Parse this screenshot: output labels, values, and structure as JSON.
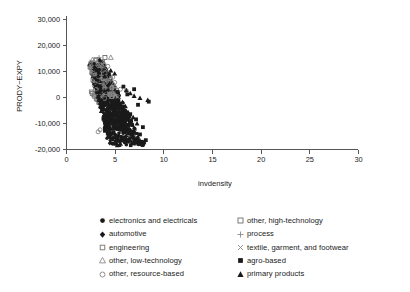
{
  "chart_data": {
    "type": "scatter",
    "title": "",
    "xlabel": "invdensity",
    "ylabel": "PRODY−EXPY",
    "xlim": [
      0,
      30
    ],
    "ylim": [
      -20000,
      30000
    ],
    "xticks": [
      0,
      5,
      10,
      15,
      20,
      25,
      30
    ],
    "xticklabels": [
      "0",
      "5",
      "10",
      "15",
      "20",
      "25",
      "30"
    ],
    "yticks": [
      30000,
      20000,
      10000,
      0,
      -10000,
      -20000
    ],
    "yticklabels": [
      "30,000",
      "20,000",
      "10,000",
      "0",
      "-10,000",
      "-20,000"
    ],
    "grid": false,
    "legend_position": "below-plot",
    "marker_color": "#1a1a1a",
    "axis_color": "#555555",
    "series": [
      {
        "name": "electronics and electricals",
        "marker": "filled-circle",
        "points": [
          [
            3.0,
            9800
          ],
          [
            3.2,
            8200
          ],
          [
            3.4,
            6400
          ],
          [
            3.6,
            5100
          ],
          [
            3.8,
            3900
          ],
          [
            3.1,
            7400
          ],
          [
            3.3,
            5600
          ],
          [
            3.5,
            4300
          ],
          [
            3.7,
            2800
          ],
          [
            3.9,
            1500
          ],
          [
            4.0,
            600
          ],
          [
            4.2,
            -900
          ],
          [
            4.4,
            -2400
          ],
          [
            4.6,
            -3800
          ],
          [
            4.8,
            -5200
          ],
          [
            4.1,
            -200
          ],
          [
            4.3,
            -1700
          ],
          [
            4.5,
            -3100
          ],
          [
            4.7,
            -4500
          ],
          [
            4.9,
            -6000
          ],
          [
            5.0,
            -6800
          ],
          [
            5.2,
            -8100
          ],
          [
            5.4,
            -9400
          ],
          [
            5.6,
            -10600
          ],
          [
            5.8,
            -11800
          ],
          [
            5.1,
            -7400
          ],
          [
            5.3,
            -8800
          ],
          [
            5.5,
            -10000
          ],
          [
            5.7,
            -11200
          ],
          [
            5.9,
            -12400
          ],
          [
            6.0,
            -13000
          ],
          [
            6.2,
            -13900
          ],
          [
            6.4,
            -14700
          ],
          [
            6.6,
            -15400
          ],
          [
            6.8,
            -16000
          ],
          [
            6.1,
            -13400
          ],
          [
            6.3,
            -14300
          ],
          [
            6.5,
            -15100
          ],
          [
            6.7,
            -15800
          ],
          [
            6.9,
            -16400
          ],
          [
            7.0,
            -16800
          ],
          [
            7.2,
            -17200
          ],
          [
            7.4,
            -17500
          ],
          [
            7.6,
            -17800
          ],
          [
            7.8,
            -18000
          ],
          [
            3.45,
            2200
          ],
          [
            3.85,
            700
          ],
          [
            4.25,
            -1200
          ],
          [
            4.65,
            -3400
          ],
          [
            5.05,
            -5900
          ],
          [
            2.9,
            6100
          ],
          [
            3.05,
            4700
          ],
          [
            3.15,
            3300
          ],
          [
            3.25,
            2000
          ],
          [
            3.55,
            900
          ],
          [
            4.15,
            -2600
          ],
          [
            4.55,
            -4800
          ],
          [
            4.95,
            -7000
          ],
          [
            5.35,
            -9200
          ],
          [
            5.75,
            -11500
          ],
          [
            6.15,
            -12900
          ],
          [
            6.55,
            -14900
          ],
          [
            6.95,
            -16600
          ],
          [
            7.35,
            -17600
          ],
          [
            7.75,
            -18200
          ]
        ]
      },
      {
        "name": "automotive",
        "marker": "filled-diamond",
        "points": [
          [
            3.3,
            7200
          ],
          [
            3.6,
            5400
          ],
          [
            3.9,
            3600
          ],
          [
            4.2,
            1800
          ],
          [
            4.5,
            -300
          ],
          [
            4.8,
            -2500
          ],
          [
            5.1,
            -4800
          ],
          [
            5.4,
            -7000
          ],
          [
            5.7,
            -9200
          ],
          [
            6.0,
            -11000
          ],
          [
            6.3,
            -12600
          ],
          [
            6.6,
            -14000
          ],
          [
            6.9,
            -15200
          ],
          [
            7.2,
            -16200
          ],
          [
            7.5,
            -17000
          ],
          [
            3.45,
            6200
          ],
          [
            3.75,
            4500
          ],
          [
            4.05,
            2700
          ],
          [
            4.35,
            800
          ],
          [
            4.65,
            -1400
          ]
        ]
      },
      {
        "name": "engineering",
        "marker": "small-square-gray",
        "points": [
          [
            2.75,
            11200
          ],
          [
            2.9,
            9400
          ],
          [
            3.05,
            7800
          ],
          [
            3.2,
            6300
          ],
          [
            3.35,
            4900
          ],
          [
            3.5,
            3500
          ],
          [
            3.65,
            2200
          ],
          [
            3.8,
            1000
          ],
          [
            3.95,
            -200
          ],
          [
            4.1,
            -1400
          ],
          [
            4.25,
            -2600
          ],
          [
            4.4,
            -3800
          ],
          [
            4.55,
            -5000
          ],
          [
            4.7,
            -6200
          ],
          [
            4.85,
            -7400
          ],
          [
            5.0,
            -8400
          ],
          [
            5.2,
            -9800
          ],
          [
            5.4,
            -11000
          ],
          [
            5.6,
            -12200
          ],
          [
            5.8,
            -13200
          ],
          [
            2.6,
            2000
          ],
          [
            2.85,
            800
          ],
          [
            3.1,
            -600
          ],
          [
            3.35,
            -2000
          ],
          [
            3.6,
            -3400
          ],
          [
            6.0,
            -14200
          ],
          [
            6.3,
            -15400
          ],
          [
            6.6,
            -16400
          ],
          [
            6.9,
            -17200
          ],
          [
            7.2,
            -17800
          ]
        ]
      },
      {
        "name": "other, low-technology",
        "marker": "open-triangle",
        "points": [
          [
            4.6,
            15200
          ],
          [
            3.1,
            10400
          ],
          [
            3.4,
            8000
          ],
          [
            3.7,
            6000
          ],
          [
            4.0,
            4000
          ],
          [
            4.3,
            2000
          ],
          [
            4.6,
            -200
          ],
          [
            4.9,
            -2400
          ],
          [
            5.2,
            -4600
          ],
          [
            5.5,
            -6800
          ],
          [
            5.8,
            -8800
          ],
          [
            6.1,
            -10600
          ],
          [
            6.4,
            -12200
          ],
          [
            6.7,
            -13600
          ],
          [
            7.0,
            -14800
          ]
        ]
      },
      {
        "name": "other, resource-based",
        "marker": "open-circle",
        "points": [
          [
            3.9,
            12600
          ],
          [
            4.3,
            11800
          ],
          [
            3.5,
            11000
          ],
          [
            3.1,
            9000
          ],
          [
            3.3,
            7000
          ],
          [
            3.7,
            5200
          ],
          [
            4.1,
            3400
          ],
          [
            4.5,
            1600
          ],
          [
            2.9,
            4400
          ],
          [
            3.0,
            2600
          ],
          [
            3.2,
            800
          ],
          [
            3.4,
            -1000
          ],
          [
            3.6,
            -2800
          ],
          [
            3.8,
            -4600
          ],
          [
            4.0,
            -6400
          ],
          [
            4.2,
            -8200
          ],
          [
            4.4,
            -9800
          ],
          [
            4.6,
            -11200
          ],
          [
            3.5,
            -12600
          ],
          [
            3.3,
            -13400
          ],
          [
            5.6,
            3000
          ],
          [
            6.2,
            2400
          ],
          [
            5.0,
            5600
          ],
          [
            4.8,
            7600
          ],
          [
            4.4,
            9400
          ]
        ]
      },
      {
        "name": "other, high-technology",
        "marker": "open-square",
        "points": [
          [
            4.0,
            15200
          ],
          [
            3.0,
            12200
          ],
          [
            3.3,
            11600
          ],
          [
            3.6,
            10800
          ],
          [
            2.8,
            10000
          ],
          [
            3.1,
            8800
          ],
          [
            2.7,
            1400
          ],
          [
            2.95,
            300
          ],
          [
            3.2,
            -900
          ],
          [
            3.45,
            -2100
          ],
          [
            3.7,
            -3300
          ],
          [
            3.95,
            -4500
          ],
          [
            4.2,
            -5700
          ],
          [
            4.45,
            -6900
          ],
          [
            4.7,
            -8100
          ],
          [
            4.95,
            -9300
          ],
          [
            5.2,
            -10400
          ],
          [
            5.45,
            -11500
          ],
          [
            5.7,
            -12500
          ],
          [
            5.95,
            -13400
          ]
        ]
      },
      {
        "name": "process",
        "marker": "plus",
        "points": [
          [
            3.4,
            15200
          ],
          [
            3.0,
            10600
          ],
          [
            3.2,
            8600
          ],
          [
            3.5,
            6600
          ],
          [
            3.8,
            4600
          ],
          [
            4.1,
            2600
          ],
          [
            4.4,
            600
          ],
          [
            4.7,
            -1400
          ],
          [
            5.0,
            -3400
          ],
          [
            5.3,
            -5400
          ],
          [
            5.6,
            -7400
          ],
          [
            5.9,
            -9400
          ],
          [
            6.2,
            -11200
          ],
          [
            6.5,
            -12800
          ],
          [
            6.8,
            -14200
          ]
        ]
      },
      {
        "name": "textile, garment, and footwear",
        "marker": "cross",
        "points": [
          [
            3.2,
            6000
          ],
          [
            3.5,
            4200
          ],
          [
            3.8,
            2400
          ],
          [
            4.1,
            600
          ],
          [
            4.4,
            -1200
          ],
          [
            4.7,
            -3000
          ],
          [
            5.0,
            -4800
          ],
          [
            5.3,
            -6600
          ],
          [
            5.6,
            -8400
          ],
          [
            5.9,
            -10200
          ],
          [
            6.2,
            -11800
          ],
          [
            6.5,
            -13200
          ],
          [
            6.8,
            -14600
          ],
          [
            7.1,
            -15800
          ],
          [
            7.4,
            -16800
          ]
        ]
      },
      {
        "name": "agro-based",
        "marker": "filled-square",
        "points": [
          [
            7.0,
            3000
          ],
          [
            6.3,
            1000
          ],
          [
            5.9,
            4000
          ],
          [
            8.2,
            -16600
          ],
          [
            7.6,
            -14400
          ],
          [
            8.5,
            -1800
          ],
          [
            7.2,
            -8600
          ],
          [
            6.8,
            -10800
          ],
          [
            6.4,
            -12600
          ],
          [
            6.0,
            -5400
          ],
          [
            5.5,
            -3200
          ],
          [
            5.1,
            -1000
          ],
          [
            4.8,
            -8800
          ],
          [
            4.4,
            -11000
          ],
          [
            4.0,
            -13000
          ],
          [
            7.9,
            -11600
          ],
          [
            7.4,
            -3000
          ],
          [
            6.6,
            -6600
          ],
          [
            8.0,
            -17400
          ],
          [
            5.3,
            -15600
          ]
        ]
      },
      {
        "name": "primary products",
        "marker": "filled-triangle",
        "points": [
          [
            4.6,
            10200
          ],
          [
            5.0,
            9000
          ],
          [
            7.0,
            400
          ],
          [
            7.6,
            -400
          ],
          [
            8.4,
            -1200
          ],
          [
            6.6,
            1400
          ],
          [
            6.2,
            2600
          ],
          [
            5.8,
            -2000
          ],
          [
            5.4,
            -4200
          ],
          [
            5.0,
            -6400
          ],
          [
            4.6,
            -8600
          ],
          [
            4.2,
            -10600
          ],
          [
            6.0,
            -12200
          ],
          [
            6.4,
            -13800
          ],
          [
            6.8,
            -15000
          ],
          [
            7.2,
            -16000
          ],
          [
            7.6,
            -16800
          ],
          [
            8.0,
            -17400
          ],
          [
            5.2,
            -17800
          ],
          [
            5.6,
            -18000
          ],
          [
            4.8,
            -16200
          ],
          [
            4.4,
            -14600
          ],
          [
            6.9,
            -7800
          ],
          [
            7.3,
            -10200
          ],
          [
            6.1,
            -3600
          ]
        ]
      }
    ]
  },
  "legend": {
    "left_column": [
      {
        "label": "electronics and electricals",
        "marker": "filled-circle"
      },
      {
        "label": "automotive",
        "marker": "filled-diamond"
      },
      {
        "label": "engineering",
        "marker": "small-square-gray"
      },
      {
        "label": "other, low-technology",
        "marker": "open-triangle"
      },
      {
        "label": "other, resource-based",
        "marker": "open-circle"
      }
    ],
    "right_column": [
      {
        "label": "other, high-technology",
        "marker": "open-square"
      },
      {
        "label": "process",
        "marker": "plus"
      },
      {
        "label": "textile, garment, and footwear",
        "marker": "cross"
      },
      {
        "label": "agro-based",
        "marker": "filled-square"
      },
      {
        "label": "primary products",
        "marker": "filled-triangle"
      }
    ]
  }
}
